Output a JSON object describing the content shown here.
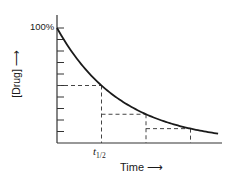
{
  "chart_data": {
    "type": "line",
    "title": "",
    "xlabel": "Time ⟶",
    "ylabel": "[Drug] ⟶",
    "y_tick_label_top": "100%",
    "x_tick_label": "t1/2",
    "x_tick_label_main": "t",
    "x_tick_label_sub": "1/2",
    "ylim": [
      0,
      100
    ],
    "y_ticks": [
      0,
      10,
      20,
      30,
      40,
      50,
      60,
      70,
      80,
      90,
      100
    ],
    "grid": false,
    "legend": null,
    "series": [
      {
        "name": "[Drug] exponential decay",
        "style": "solid",
        "x_half_lives": [
          0,
          0.5,
          1,
          1.5,
          2,
          2.5,
          3,
          3.5,
          3.62
        ],
        "values": [
          100,
          70.7,
          50,
          35.4,
          25,
          17.7,
          12.5,
          8.8,
          8.1
        ]
      }
    ],
    "annotations": [
      {
        "type": "dashed-guide",
        "x_half_lives": 1,
        "y_percent": 50
      },
      {
        "type": "dashed-guide",
        "x_half_lives": 2,
        "y_percent": 25
      },
      {
        "type": "dashed-guide",
        "x_half_lives": 3,
        "y_percent": 12.5
      }
    ]
  },
  "labels": {
    "ylabel": "[Drug] ⟶",
    "xlabel": "Time ⟶",
    "ytop": "100%",
    "thalf_main": "t",
    "thalf_sub": "1/2"
  },
  "colors": {
    "line": "#1a1a1a",
    "axis": "#333333",
    "dash": "#444444",
    "background": "#ffffff"
  }
}
